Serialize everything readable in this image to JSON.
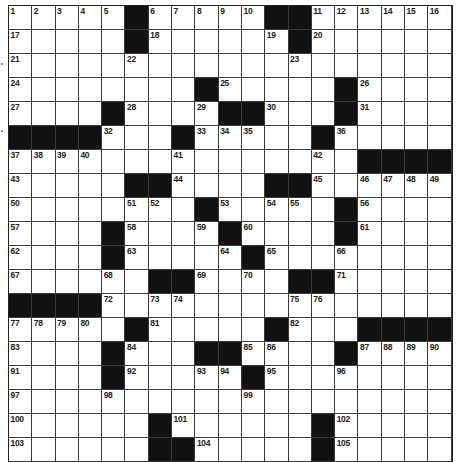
{
  "puzzle": {
    "type": "crossword",
    "cols": 19,
    "visible_rows": 19,
    "colors": {
      "block": "#111111",
      "cell": "#ffffff",
      "grid_line": "#3a3a3a",
      "number": "#222222"
    },
    "rows": [
      {
        "pattern": ".....#.....##......",
        "numbers": {
          "0": 1,
          "1": 2,
          "2": 3,
          "3": 4,
          "4": 5,
          "6": 6,
          "7": 7,
          "8": 8,
          "9": 9,
          "10": 10,
          "13": 11,
          "14": 12,
          "15": 13,
          "16": 14,
          "17": 15,
          "18": 16
        }
      },
      {
        "pattern": ".....#......#......",
        "numbers": {
          "0": 17,
          "6": 18,
          "11": 19,
          "13": 20
        }
      },
      {
        "pattern": "...................",
        "numbers": {
          "0": 21,
          "5": 22,
          "12": 23
        }
      },
      {
        "pattern": "........#.....#....",
        "numbers": {
          "0": 24,
          "9": 25,
          "15": 26
        }
      },
      {
        "pattern": "....#....##...#....",
        "numbers": {
          "0": 27,
          "5": 28,
          "8": 29,
          "11": 30,
          "15": 31
        }
      },
      {
        "pattern": "####...#.....#.....",
        "numbers": {
          "4": 32,
          "8": 33,
          "9": 34,
          "10": 35,
          "14": 36
        }
      },
      {
        "pattern": "...............####",
        "numbers": {
          "0": 37,
          "1": 38,
          "2": 39,
          "3": 40,
          "7": 41,
          "13": 42
        }
      },
      {
        "pattern": ".....##....##......",
        "numbers": {
          "0": 43,
          "7": 44,
          "13": 45,
          "15": 46,
          "16": 47,
          "17": 48,
          "18": 49
        }
      },
      {
        "pattern": "........#.....#....",
        "numbers": {
          "0": 50,
          "5": 51,
          "6": 52,
          "9": 53,
          "11": 54,
          "12": 55,
          "15": 56
        }
      },
      {
        "pattern": "....#....#....#....",
        "numbers": {
          "0": 57,
          "5": 58,
          "8": 59,
          "10": 60,
          "15": 61
        }
      },
      {
        "pattern": "....#.....#........",
        "numbers": {
          "0": 62,
          "5": 63,
          "9": 64,
          "11": 65,
          "14": 66
        }
      },
      {
        "pattern": "......##....##.....",
        "numbers": {
          "0": 67,
          "4": 68,
          "8": 69,
          "10": 70,
          "14": 71
        }
      },
      {
        "pattern": "####...............",
        "numbers": {
          "4": 72,
          "6": 73,
          "7": 74,
          "12": 75,
          "13": 76
        }
      },
      {
        "pattern": ".....#.....#...####",
        "numbers": {
          "0": 77,
          "1": 78,
          "2": 79,
          "3": 80,
          "6": 81,
          "12": 82
        }
      },
      {
        "pattern": "....#...##....#....",
        "numbers": {
          "0": 83,
          "5": 84,
          "10": 85,
          "11": 86,
          "15": 87,
          "16": 88,
          "17": 89,
          "18": 90
        }
      },
      {
        "pattern": "....#.....#........",
        "numbers": {
          "0": 91,
          "5": 92,
          "8": 93,
          "9": 94,
          "11": 95,
          "14": 96
        }
      },
      {
        "pattern": "...................",
        "numbers": {
          "0": 97,
          "4": 98,
          "10": 99
        }
      },
      {
        "pattern": "......#......#.....",
        "numbers": {
          "0": 100,
          "7": 101,
          "14": 102
        }
      },
      {
        "pattern": "......##.....#.....",
        "numbers": {
          "0": 103,
          "8": 104,
          "14": 105
        }
      }
    ]
  }
}
